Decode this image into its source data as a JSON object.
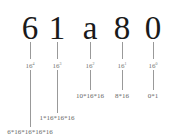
{
  "diagram": {
    "hex_number": "61a80",
    "digits": [
      {
        "char": "6",
        "base": "16",
        "exp": "4",
        "formula": "6*16*16*16*16"
      },
      {
        "char": "1",
        "base": "16",
        "exp": "3",
        "formula": "1*16*16*16"
      },
      {
        "char": "a",
        "base": "16",
        "exp": "2",
        "formula": "10*16*16"
      },
      {
        "char": "8",
        "base": "16",
        "exp": "1",
        "formula": "8*16"
      },
      {
        "char": "0",
        "base": "16",
        "exp": "0",
        "formula": "0*1"
      }
    ]
  }
}
